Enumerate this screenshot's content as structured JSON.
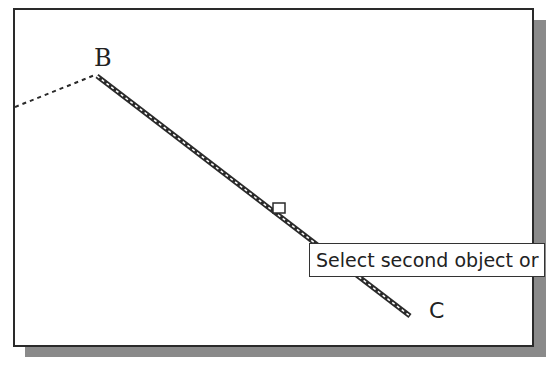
{
  "drawing": {
    "points": {
      "B": {
        "label": "B"
      },
      "C": {
        "label": "C"
      }
    },
    "tooltip": {
      "text": "Select second object or"
    },
    "colors": {
      "line": "#2a2a2a",
      "shadow": "#8a8a8a",
      "background": "#ffffff"
    }
  }
}
